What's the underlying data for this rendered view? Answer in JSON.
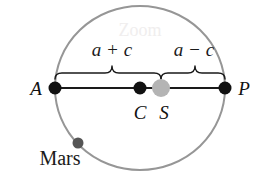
{
  "figure": {
    "background_color": "#ffffff"
  },
  "orbit": {
    "name": "orbit-ellipse",
    "stroke_color": "#969696",
    "center_x": 140,
    "center_y": 88,
    "rx": 85,
    "ry": 82,
    "stroke_width": 2
  },
  "axis": {
    "name": "major-axis",
    "stroke_color": "#1a1a1a",
    "x1": 55,
    "y1": 88,
    "x2": 225,
    "y2": 88,
    "stroke_width": 2.2
  },
  "points": [
    {
      "id": "A",
      "label": "A",
      "label_x": 36,
      "label_y": 95,
      "x": 55,
      "y": 88,
      "r": 6.5,
      "color": "#111111"
    },
    {
      "id": "C",
      "label": "C",
      "label_x": 140,
      "label_y": 119,
      "x": 140,
      "y": 88,
      "r": 6.5,
      "color": "#111111"
    },
    {
      "id": "S",
      "label": "S",
      "label_x": 164,
      "label_y": 119,
      "x": 161,
      "y": 88,
      "r": 9,
      "color": "#b4b4b4"
    },
    {
      "id": "P",
      "label": "P",
      "label_x": 244,
      "label_y": 95,
      "x": 225,
      "y": 88,
      "r": 6.5,
      "color": "#111111"
    }
  ],
  "braces": [
    {
      "id": "brace-a-plus-c",
      "from_x": 55,
      "to_x": 161,
      "peak_x": 112,
      "baseline_y": 73,
      "tip_y": 66,
      "stroke_color": "#1a1a1a",
      "label": "a + c",
      "label_x": 112,
      "label_y": 56
    },
    {
      "id": "brace-a-minus-c",
      "from_x": 161,
      "to_x": 225,
      "peak_x": 195,
      "baseline_y": 73,
      "tip_y": 66,
      "stroke_color": "#1a1a1a",
      "label": "a − c",
      "label_x": 194,
      "label_y": 56
    }
  ],
  "mars": {
    "name": "mars-body",
    "label": "Mars",
    "label_x": 60,
    "label_y": 165,
    "dot_x": 78,
    "dot_y": 143,
    "dot_r": 5.5,
    "dot_color": "#555555"
  },
  "watermark": {
    "text": "Zoom",
    "x": 140,
    "y": 36,
    "color": "#f0eeee"
  },
  "font_sizes": {
    "math_label": 19,
    "point_label": 19,
    "body_label": 20,
    "watermark": 18
  }
}
